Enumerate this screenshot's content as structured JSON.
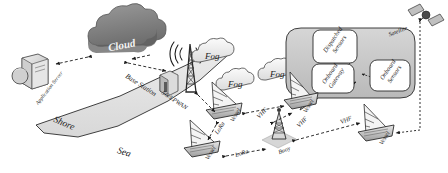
{
  "diagram": {
    "type": "network-architecture-diagram",
    "regions": [
      {
        "id": "shore",
        "label": "Shore",
        "fill": "#e3e3e3"
      },
      {
        "id": "sea",
        "label": "Sea",
        "fill": "#ffffff"
      }
    ],
    "nodes": {
      "cloud": {
        "label": "Cloud",
        "icon": "cloud-icon",
        "fill": "#8c8c8c"
      },
      "application_server": {
        "label": "Application Server",
        "icon": "server-icon"
      },
      "base_station": {
        "label": "Base Station",
        "icon": "antenna-tower-icon"
      },
      "satellite": {
        "label": "Satellite",
        "icon": "satellite-icon"
      },
      "buoy": {
        "label": "Buoy",
        "icon": "buoy-icon"
      },
      "fog_base": {
        "label": "Fog",
        "icon": "fog-cloud-icon"
      },
      "fog_vessel_a": {
        "label": "Fog",
        "icon": "fog-cloud-icon"
      },
      "fog_vessel_b": {
        "label": "Fog",
        "icon": "fog-cloud-icon"
      },
      "vessel_1": {
        "label": "Vessel",
        "icon": "sailboat-icon"
      },
      "vessel_2": {
        "label": "Vessel",
        "icon": "sailboat-icon"
      },
      "vessel_3": {
        "label": "Vessel",
        "icon": "sailboat-icon"
      },
      "vessel_4": {
        "label": "Vessel",
        "icon": "sailboat-icon"
      }
    },
    "callout": {
      "name": "onboard-detail-callout",
      "boxes": [
        {
          "id": "dispatched_sensors",
          "label": "Dispatched Sensors"
        },
        {
          "id": "onboard_gateway",
          "label": "Onboard Gateway"
        },
        {
          "id": "onboard_sensors",
          "label": "Onboard Sensors"
        }
      ]
    },
    "links": [
      {
        "id": "l1",
        "label": "",
        "from": "cloud",
        "to": "application_server"
      },
      {
        "id": "l2",
        "label": "",
        "from": "cloud",
        "to": "base_station"
      },
      {
        "id": "l3",
        "label": "5G/LPWAN",
        "from": "base_station",
        "to": "vessel_1"
      },
      {
        "id": "l4",
        "label": "LoRa",
        "from": "vessel_1",
        "to": "vessel_2"
      },
      {
        "id": "l5",
        "label": "LoRa",
        "from": "vessel_2",
        "to": "buoy"
      },
      {
        "id": "l6",
        "label": "VHF",
        "from": "vessel_1",
        "to": "vessel_3"
      },
      {
        "id": "l7",
        "label": "VHF",
        "from": "vessel_3",
        "to": "buoy"
      },
      {
        "id": "l8",
        "label": "VHF",
        "from": "buoy",
        "to": "vessel_4"
      },
      {
        "id": "l9",
        "label": "",
        "from": "satellite",
        "to": "vessel_4"
      }
    ],
    "link_labels": {
      "lpwan": "5G/LPWAN",
      "lora_upper": "LoRa",
      "lora_lower": "LoRa",
      "vhf_left": "VHF",
      "vhf_mid": "VHF",
      "vhf_right": "VHF"
    },
    "colors": {
      "shore_fill": "#e3e3e3",
      "cloud_fill": "#8c8c8c",
      "fog_fill": "#f2f2f2",
      "callout_fill": "#c9c9c9",
      "box_fill": "#ffffff",
      "stroke": "#2b2b2b",
      "text": "#1a1a1a"
    }
  }
}
